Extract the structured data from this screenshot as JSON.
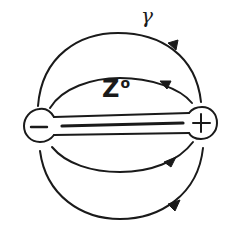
{
  "diagram": {
    "labels": {
      "gamma": "γ",
      "z_base": "Z",
      "z_sup": "o"
    },
    "charges": {
      "left": "−",
      "right": "+"
    },
    "field_lines": [
      {
        "name": "outer-top",
        "direction": "right-to-left"
      },
      {
        "name": "inner-top",
        "direction": "right-to-left"
      },
      {
        "name": "inner-bottom",
        "direction": "left-to-right"
      },
      {
        "name": "outer-bottom",
        "direction": "left-to-right"
      }
    ],
    "colors": {
      "ink": "#1a1a1a",
      "background": "#ffffff"
    }
  }
}
